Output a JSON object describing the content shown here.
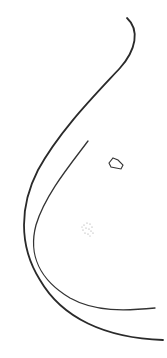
{
  "drawing": {
    "background": "#ffffff",
    "stroke_color": "#2a2a2a",
    "shapes": [
      {
        "name": "outer-curve",
        "path": "M127,18 C140,30 136,50 120,68 C95,95 60,130 38,170 C20,205 18,245 40,280 C62,318 105,338 163,340",
        "width": 1.8
      },
      {
        "name": "inner-curve",
        "path": "M88,141 C70,165 45,195 36,225 C28,255 40,280 70,298 C95,312 125,311 155,308",
        "width": 1.3
      },
      {
        "name": "small-polygon",
        "path": "M113,158 L118,160 L123,165 L121,169 L111,167 L109,163 Z",
        "width": 1.1
      }
    ],
    "stipple": {
      "cx": 88,
      "cy": 229,
      "r": 6,
      "color": "#9a9a9a"
    }
  }
}
